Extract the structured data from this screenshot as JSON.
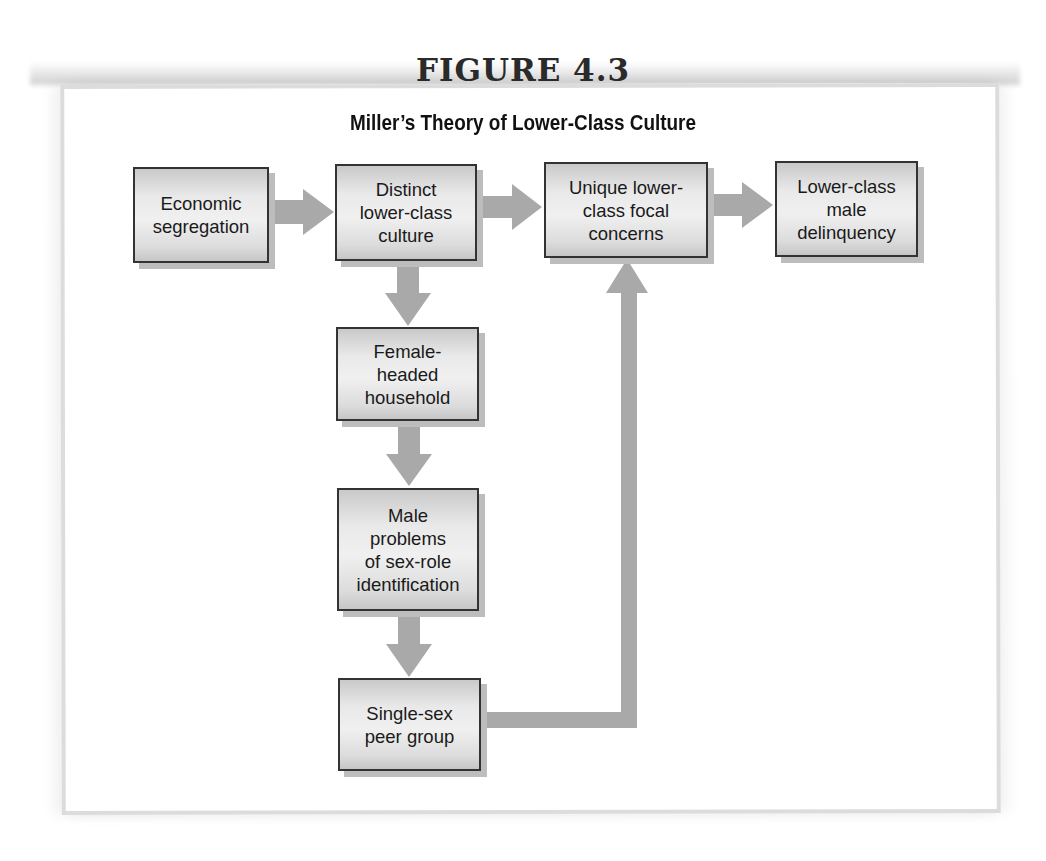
{
  "figure": {
    "label": "FIGURE 4.3",
    "title": "Miller’s Theory of Lower-Class Culture"
  },
  "nodes": [
    {
      "id": "economic-segregation",
      "text": "Economic\nsegregation"
    },
    {
      "id": "distinct-lower-class-culture",
      "text": "Distinct\nlower-class\nculture"
    },
    {
      "id": "unique-focal-concerns",
      "text": "Unique lower-\nclass focal\nconcerns"
    },
    {
      "id": "lower-class-male-delinquency",
      "text": "Lower-class\nmale\ndelinquency"
    },
    {
      "id": "female-headed-household",
      "text": "Female-\nheaded\nhousehold"
    },
    {
      "id": "male-sex-role-problems",
      "text": "Male\nproblems\nof sex-role\nidentification"
    },
    {
      "id": "single-sex-peer-group",
      "text": "Single-sex\npeer group"
    }
  ],
  "edges": [
    {
      "from": "economic-segregation",
      "to": "distinct-lower-class-culture"
    },
    {
      "from": "distinct-lower-class-culture",
      "to": "unique-focal-concerns"
    },
    {
      "from": "unique-focal-concerns",
      "to": "lower-class-male-delinquency"
    },
    {
      "from": "distinct-lower-class-culture",
      "to": "female-headed-household"
    },
    {
      "from": "female-headed-household",
      "to": "male-sex-role-problems"
    },
    {
      "from": "male-sex-role-problems",
      "to": "single-sex-peer-group"
    },
    {
      "from": "single-sex-peer-group",
      "to": "unique-focal-concerns"
    }
  ],
  "colors": {
    "arrow": "#a9a9a9",
    "box_border": "#333333",
    "frame": "#dcdcdc",
    "text": "#1a1a1a"
  }
}
